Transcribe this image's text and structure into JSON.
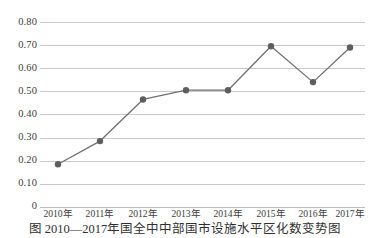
{
  "chart_data": {
    "type": "line",
    "title": "",
    "xlabel": "",
    "ylabel": "",
    "categories": [
      "2010年",
      "2011年",
      "2012年",
      "2013年",
      "2014年",
      "2015年",
      "2016年",
      "2017年"
    ],
    "values": [
      0.185,
      0.285,
      0.465,
      0.505,
      0.505,
      0.695,
      0.54,
      0.69
    ],
    "series": [
      {
        "name": "",
        "values": [
          0.185,
          0.285,
          0.465,
          0.505,
          0.505,
          0.695,
          0.54,
          0.69
        ]
      }
    ],
    "ylim": [
      0,
      0.8
    ],
    "yticks": [
      0,
      0.1,
      0.2,
      0.3,
      0.4,
      0.5,
      0.6,
      0.7,
      0.8
    ],
    "ytick_labels": [
      "0",
      "0.10",
      "0.20",
      "0.30",
      "0.40",
      "0.50",
      "0.60",
      "0.70",
      "0.80"
    ],
    "grid": "horizontal",
    "legend": "none",
    "marker": "circle",
    "line_color": "#6f6f6f",
    "marker_color": "#5e5e5e",
    "grid_color": "#c9c9c9"
  },
  "caption": {
    "text": "图 2010—2017年国全中中部国市设施水平区化数变势图"
  }
}
